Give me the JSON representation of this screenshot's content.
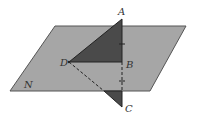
{
  "diagram": {
    "plane_label": "N",
    "points": {
      "A": "A",
      "B": "B",
      "C": "C",
      "D": "D"
    },
    "colors": {
      "plane_fill": "#a6a6a6",
      "plane_stroke": "#555555",
      "triangle_fill": "#4a4a4a",
      "line": "#222222"
    }
  }
}
